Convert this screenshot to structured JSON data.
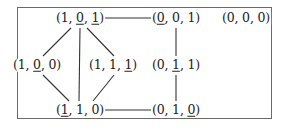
{
  "diagram": {
    "nodes": [
      {
        "id": "n101",
        "x": 80,
        "y": 18,
        "coords": [
          "1",
          "0",
          "1"
        ],
        "underline": [
          false,
          true,
          true
        ]
      },
      {
        "id": "n001",
        "x": 176,
        "y": 18,
        "coords": [
          "0",
          "0",
          "1"
        ],
        "underline": [
          true,
          false,
          false
        ]
      },
      {
        "id": "n000",
        "x": 246,
        "y": 18,
        "coords": [
          "0",
          "0",
          "0"
        ],
        "underline": [
          false,
          false,
          false
        ]
      },
      {
        "id": "n100",
        "x": 37,
        "y": 65,
        "coords": [
          "1",
          "0",
          "0"
        ],
        "underline": [
          false,
          true,
          false
        ]
      },
      {
        "id": "n111",
        "x": 113,
        "y": 65,
        "coords": [
          "1",
          "1",
          "1"
        ],
        "underline": [
          false,
          false,
          true
        ]
      },
      {
        "id": "n011",
        "x": 176,
        "y": 65,
        "coords": [
          "0",
          "1",
          "1"
        ],
        "underline": [
          false,
          true,
          false
        ]
      },
      {
        "id": "n110",
        "x": 80,
        "y": 110,
        "coords": [
          "1",
          "1",
          "0"
        ],
        "underline": [
          true,
          false,
          false
        ]
      },
      {
        "id": "n010",
        "x": 176,
        "y": 110,
        "coords": [
          "0",
          "1",
          "0"
        ],
        "underline": [
          false,
          false,
          true
        ]
      }
    ],
    "edges": [
      {
        "from": "n101",
        "to": "n001",
        "x1": 104,
        "y1": 18,
        "x2": 152,
        "y2": 18
      },
      {
        "from": "n101",
        "to": "n100",
        "x1": 71,
        "y1": 28,
        "x2": 43,
        "y2": 56
      },
      {
        "from": "n101",
        "to": "n110",
        "x1": 80,
        "y1": 28,
        "x2": 79,
        "y2": 101
      },
      {
        "from": "n101",
        "to": "n111",
        "x1": 87,
        "y1": 28,
        "x2": 114,
        "y2": 56
      },
      {
        "from": "n100",
        "to": "n110",
        "x1": 43,
        "y1": 75,
        "x2": 69,
        "y2": 101
      },
      {
        "from": "n111",
        "to": "n110",
        "x1": 114,
        "y1": 75,
        "x2": 93,
        "y2": 101
      },
      {
        "from": "n001",
        "to": "n011",
        "x1": 176,
        "y1": 28,
        "x2": 176,
        "y2": 56
      },
      {
        "from": "n011",
        "to": "n010",
        "x1": 176,
        "y1": 75,
        "x2": 176,
        "y2": 101
      },
      {
        "from": "n110",
        "to": "n010",
        "x1": 103,
        "y1": 110,
        "x2": 151,
        "y2": 110
      }
    ],
    "stroke_color": "#333333",
    "border_color": "#6a6a6a"
  }
}
